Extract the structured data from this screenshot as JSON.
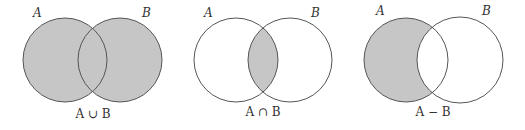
{
  "colors": {
    "shade": "#c6c6c6",
    "stroke": "#555555",
    "background": "#ffffff"
  },
  "diagrams": [
    {
      "operation": "union",
      "set_a_label": "A",
      "set_b_label": "B",
      "caption": "A ∪ B",
      "shaded_region": "A or B"
    },
    {
      "operation": "intersection",
      "set_a_label": "A",
      "set_b_label": "B",
      "caption": "A ∩ B",
      "shaded_region": "A and B"
    },
    {
      "operation": "difference",
      "set_a_label": "A",
      "set_b_label": "B",
      "caption": "A − B",
      "shaded_region": "A not B"
    }
  ]
}
